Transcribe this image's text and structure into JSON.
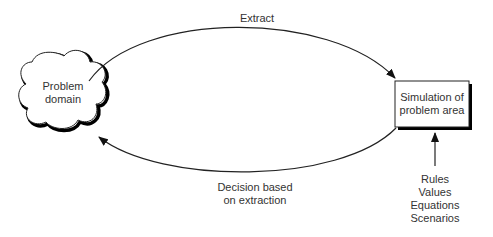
{
  "diagram": {
    "nodes": {
      "problem_domain": {
        "line1": "Problem",
        "line2": "domain",
        "shape": "cloud"
      },
      "simulation": {
        "line1": "Simulation of",
        "line2": "problem area",
        "shape": "box"
      }
    },
    "edges": {
      "extract": {
        "label": "Extract",
        "from": "problem_domain",
        "to": "simulation"
      },
      "decision": {
        "line1": "Decision based",
        "line2": "on extraction",
        "from": "simulation",
        "to": "problem_domain"
      },
      "inputs": {
        "to": "simulation",
        "items": [
          "Rules",
          "Values",
          "Equations",
          "Scenarios"
        ]
      }
    }
  }
}
